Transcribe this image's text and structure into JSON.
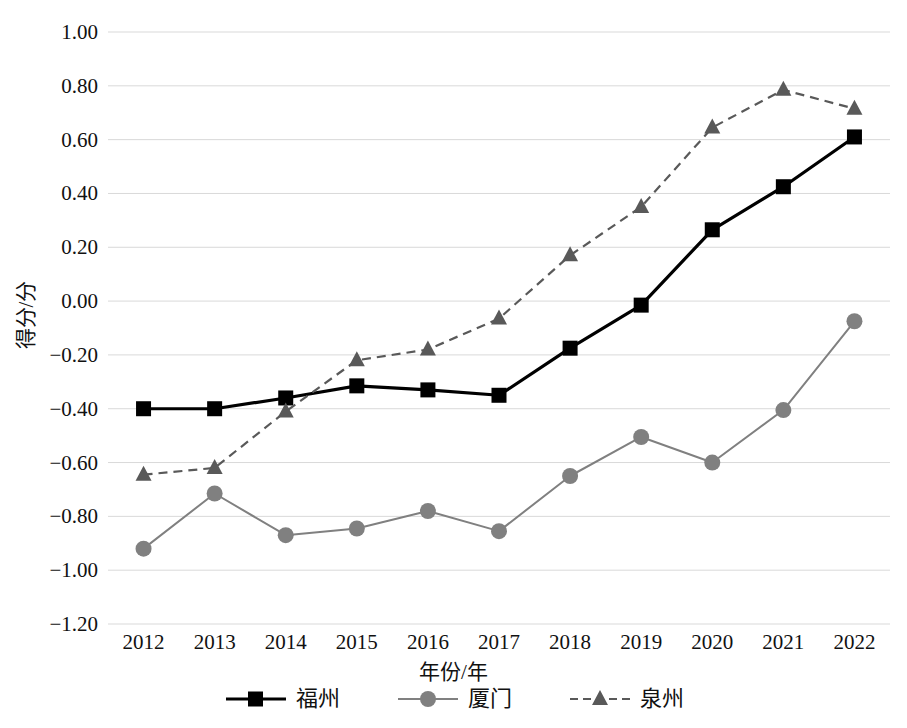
{
  "chart_data": {
    "type": "line",
    "title": "",
    "xlabel": "年份/年",
    "ylabel": "得分/分",
    "x": [
      2012,
      2013,
      2014,
      2015,
      2016,
      2017,
      2018,
      2019,
      2020,
      2021,
      2022
    ],
    "categories": [
      "2012",
      "2013",
      "2014",
      "2015",
      "2016",
      "2017",
      "2018",
      "2019",
      "2020",
      "2021",
      "2022"
    ],
    "ylim": [
      -1.2,
      1.0
    ],
    "ytick_values": [
      1.0,
      0.8,
      0.6,
      0.4,
      0.2,
      0.0,
      -0.2,
      -0.4,
      -0.6,
      -0.8,
      -1.0,
      -1.2
    ],
    "ytick_labels": [
      "1.00",
      "0.80",
      "0.60",
      "0.40",
      "0.20",
      "0.00",
      "−0.20",
      "−0.40",
      "−0.60",
      "−0.80",
      "−1.00",
      "−1.20"
    ],
    "grid": true,
    "legend_position": "bottom",
    "series": [
      {
        "name": "福州",
        "color": "#000000",
        "marker": "square",
        "linestyle": "solid",
        "values": [
          -0.4,
          -0.4,
          -0.36,
          -0.315,
          -0.33,
          -0.35,
          -0.175,
          -0.015,
          0.265,
          0.425,
          0.61
        ]
      },
      {
        "name": "厦门",
        "color": "#808080",
        "marker": "circle",
        "linestyle": "solid",
        "values": [
          -0.92,
          -0.715,
          -0.87,
          -0.845,
          -0.78,
          -0.855,
          -0.65,
          -0.505,
          -0.6,
          -0.405,
          -0.075
        ]
      },
      {
        "name": "泉州",
        "color": "#595959",
        "marker": "triangle",
        "linestyle": "dashed",
        "values": [
          -0.645,
          -0.62,
          -0.41,
          -0.22,
          -0.18,
          -0.065,
          0.17,
          0.35,
          0.645,
          0.785,
          0.715
        ]
      }
    ]
  },
  "legend": {
    "items": [
      {
        "label": "福州"
      },
      {
        "label": "厦门"
      },
      {
        "label": "泉州"
      }
    ]
  },
  "colors": {
    "grid": "#d9d9d9",
    "fuzhou": "#000000",
    "xiamen": "#808080",
    "quanzhou": "#595959",
    "text": "#111111",
    "background": "#ffffff"
  }
}
